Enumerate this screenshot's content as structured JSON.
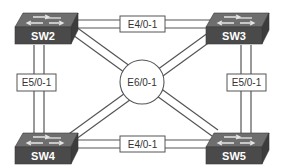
{
  "diagram": {
    "switches": [
      {
        "id": "sw2",
        "label": "SW2"
      },
      {
        "id": "sw3",
        "label": "SW3"
      },
      {
        "id": "sw4",
        "label": "SW4"
      },
      {
        "id": "sw5",
        "label": "SW5"
      }
    ],
    "links": {
      "top": {
        "label": "E4/0-1",
        "from": "SW2",
        "to": "SW3"
      },
      "bottom": {
        "label": "E4/0-1",
        "from": "SW4",
        "to": "SW5"
      },
      "left": {
        "label": "E5/0-1",
        "from": "SW2",
        "to": "SW4"
      },
      "right": {
        "label": "E5/0-1",
        "from": "SW3",
        "to": "SW5"
      },
      "center": {
        "label": "E6/0-1",
        "from": [
          "SW2",
          "SW5"
        ],
        "to": [
          "SW3",
          "SW4"
        ]
      }
    }
  }
}
